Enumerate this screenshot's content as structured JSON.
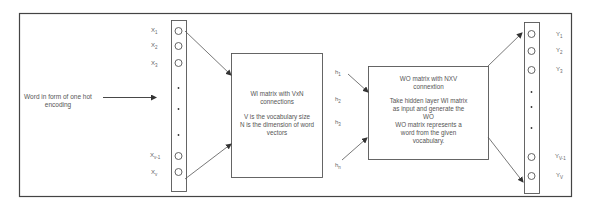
{
  "input_text": [
    "Word in form of one hot",
    "encoding"
  ],
  "input_nodes": [
    {
      "base": "X",
      "sub": "1",
      "y": 31
    },
    {
      "base": "X",
      "sub": "2",
      "y": 46
    },
    {
      "base": "X",
      "sub": "3",
      "y": 63
    },
    {
      "base": "X",
      "sub": "v-1",
      "y": 156
    },
    {
      "base": "X",
      "sub": "v",
      "y": 173
    }
  ],
  "hidden_nodes": [
    {
      "base": "h",
      "sub": "1",
      "y": 73
    },
    {
      "base": "h",
      "sub": "2",
      "y": 99
    },
    {
      "base": "h",
      "sub": "3",
      "y": 122
    },
    {
      "base": "h",
      "sub": "n",
      "y": 165
    }
  ],
  "output_nodes": [
    {
      "base": "Y",
      "sub": "1",
      "y": 35
    },
    {
      "base": "Y",
      "sub": "2",
      "y": 50
    },
    {
      "base": "Y",
      "sub": "3",
      "y": 69
    },
    {
      "base": "Y",
      "sub": "V-1",
      "y": 157
    },
    {
      "base": "Y",
      "sub": "V",
      "y": 176
    }
  ],
  "wi_box": {
    "title": [
      "WI matrix with VxN",
      "connections"
    ],
    "desc": [
      "V is the vocabulary size",
      "N is the dimension of word",
      "vectors"
    ]
  },
  "wo_box": {
    "title": [
      "WO matrix with NXV",
      "connextion"
    ],
    "desc": [
      "Take hidden layer WI matrix",
      "as input and generate the",
      "WO",
      "WO matrix represents a",
      "word from the given",
      "vocabulary."
    ]
  },
  "colors": {
    "line": "#555555",
    "border": "#444444",
    "text": "#555555"
  }
}
